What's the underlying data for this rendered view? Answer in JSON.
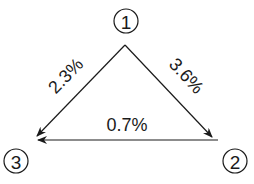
{
  "diagram": {
    "nodes": [
      {
        "id": "1",
        "label": "1",
        "cx": 126,
        "cy": 21
      },
      {
        "id": "2",
        "label": "2",
        "cx": 235,
        "cy": 161
      },
      {
        "id": "3",
        "label": "3",
        "cx": 16,
        "cy": 161
      }
    ],
    "edges": [
      {
        "from": "1",
        "to": "3",
        "label": "2.3%"
      },
      {
        "from": "1",
        "to": "2",
        "label": "3.6%"
      },
      {
        "from": "2",
        "to": "3",
        "label": "0.7%"
      }
    ]
  }
}
